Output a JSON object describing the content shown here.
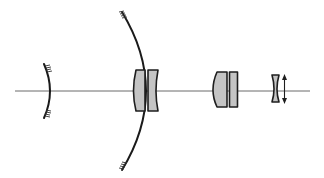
{
  "diagram": {
    "type": "optical-layout",
    "description": "Catadioptric telescope optical layout with mirrors and lens groups along an optical axis",
    "colors": {
      "background": "#ffffff",
      "axis": "#6a6a6a",
      "stroke": "#1e1e1e",
      "lens_fill": "#c4c4c4"
    },
    "elements": [
      {
        "id": "optical-axis",
        "kind": "line"
      },
      {
        "id": "secondary-mirror",
        "kind": "convex mirror (small)"
      },
      {
        "id": "primary-mirror",
        "kind": "concave mirror (large)"
      },
      {
        "id": "corrector-doublet",
        "kind": "lens pair"
      },
      {
        "id": "field-doublet",
        "kind": "lens pair"
      },
      {
        "id": "negative-lens",
        "kind": "biconcave lens"
      },
      {
        "id": "focus-adjust-arrow",
        "kind": "double-headed arrow"
      }
    ]
  }
}
